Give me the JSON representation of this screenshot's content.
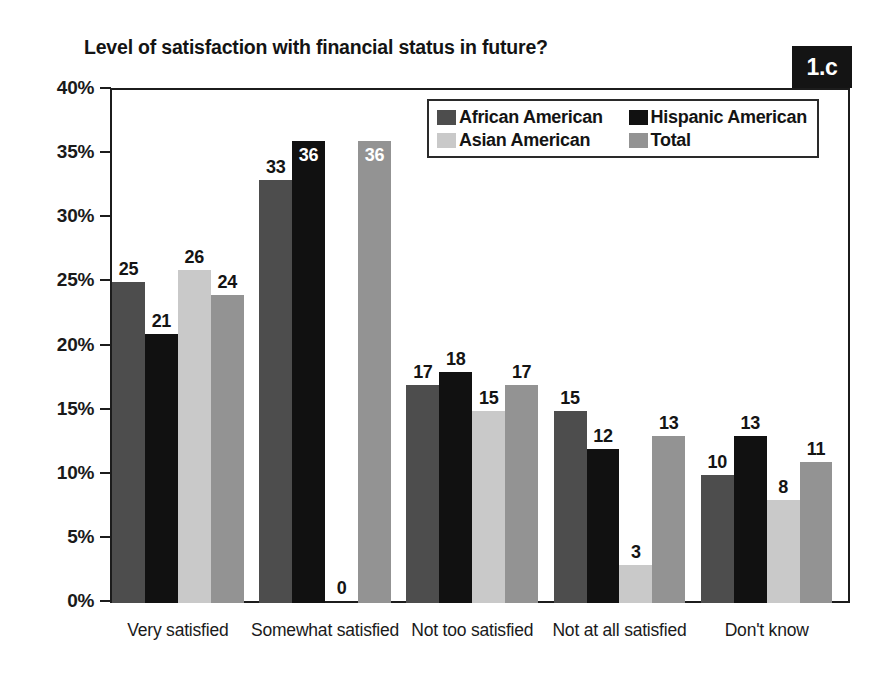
{
  "chart_data": {
    "type": "bar",
    "title": "Level of satisfaction with financial status in future?",
    "panel_label": "1.c",
    "xlabel": "",
    "ylabel": "",
    "ylim": [
      0,
      40
    ],
    "ytick_values": [
      40,
      35,
      30,
      25,
      20,
      15,
      10,
      5,
      0
    ],
    "ytick_labels": [
      "40%",
      "35%",
      "30%",
      "25%",
      "20%",
      "15%",
      "10%",
      "5%",
      "0%"
    ],
    "grid": false,
    "legend_position": "top-right-inside",
    "value_suffix": "",
    "categories": [
      "Very satisfied",
      "Somewhat satisfied",
      "Not too satisfied",
      "Not at all satisfied",
      "Don't know"
    ],
    "series": [
      {
        "name": "African American",
        "color": "#4d4d4d",
        "values": [
          25,
          33,
          17,
          15,
          10
        ],
        "label_inside": [
          false,
          false,
          false,
          false,
          false
        ]
      },
      {
        "name": "Hispanic American",
        "color": "#111111",
        "values": [
          21,
          36,
          18,
          12,
          13
        ],
        "label_inside": [
          false,
          true,
          false,
          false,
          false
        ]
      },
      {
        "name": "Asian American",
        "color": "#c9c9c9",
        "values": [
          26,
          0,
          15,
          3,
          8
        ],
        "label_inside": [
          false,
          false,
          false,
          false,
          false
        ]
      },
      {
        "name": "Total",
        "color": "#939393",
        "values": [
          24,
          36,
          17,
          13,
          11
        ],
        "label_inside": [
          false,
          true,
          false,
          false,
          false
        ]
      }
    ]
  },
  "colors": {
    "african_american": "#4d4d4d",
    "hispanic_american": "#111111",
    "asian_american": "#c9c9c9",
    "total": "#939393",
    "axis": "#1c1c1c",
    "text": "#141414",
    "background": "#ffffff",
    "badge_background": "#141414",
    "badge_text": "#ffffff"
  }
}
